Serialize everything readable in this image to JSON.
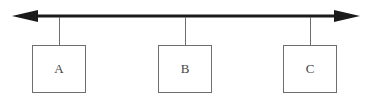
{
  "diagram": {
    "type": "bus-topology",
    "bus_line": {
      "style": "double-headed-arrow",
      "color": "#1a1a1a"
    },
    "nodes": [
      {
        "label": "A"
      },
      {
        "label": "B"
      },
      {
        "label": "C"
      }
    ],
    "colors": {
      "line": "#1a1a1a",
      "connector": "#6e6e6e",
      "box_border": "#6e6e6e",
      "text": "#444444"
    }
  }
}
